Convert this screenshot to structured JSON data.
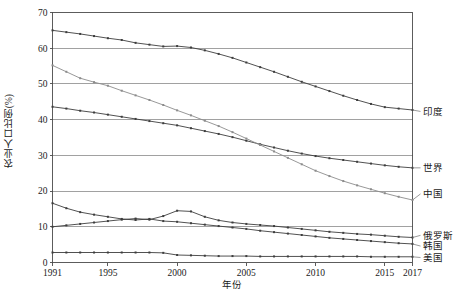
{
  "chart_data": {
    "type": "line",
    "title": "",
    "xlabel": "年份",
    "ylabel": "农业人口比例(%)",
    "xlim": [
      1991,
      2017
    ],
    "ylim": [
      0,
      70
    ],
    "ytick_values": [
      0,
      10,
      20,
      30,
      40,
      50,
      60,
      70
    ],
    "ytick_labels": [
      "0",
      "10",
      "20",
      "30",
      "40",
      "50",
      "60",
      "70"
    ],
    "xtick_values": [
      1991,
      1995,
      2000,
      2005,
      2010,
      2015,
      2017
    ],
    "xtick_labels": [
      "1991",
      "1995",
      "2000",
      "2005",
      "2010",
      "2015",
      "2017"
    ],
    "grid": "horizontal",
    "legend_position": "right-inline-labels",
    "x": [
      1991,
      1992,
      1993,
      1994,
      1995,
      1996,
      1997,
      1998,
      1999,
      2000,
      2001,
      2002,
      2003,
      2004,
      2005,
      2006,
      2007,
      2008,
      2009,
      2010,
      2011,
      2012,
      2013,
      2014,
      2015,
      2016,
      2017
    ],
    "series": [
      {
        "name": "印度",
        "color": "#3d3d3d",
        "values": [
          65.0,
          64.5,
          64.0,
          63.4,
          62.8,
          62.3,
          61.5,
          61.0,
          60.5,
          60.6,
          60.2,
          59.4,
          58.4,
          57.3,
          56.0,
          54.7,
          53.4,
          52.0,
          50.6,
          49.3,
          48.0,
          46.7,
          45.5,
          44.4,
          43.5,
          43.1,
          42.7
        ]
      },
      {
        "name": "世界",
        "color": "#3d3d3d",
        "values": [
          43.6,
          43.1,
          42.5,
          42.0,
          41.4,
          40.8,
          40.2,
          39.6,
          39.0,
          38.4,
          37.6,
          36.8,
          36.0,
          35.1,
          34.1,
          33.1,
          32.2,
          31.3,
          30.5,
          29.8,
          29.2,
          28.7,
          28.2,
          27.7,
          27.2,
          26.8,
          26.5
        ]
      },
      {
        "name": "中国",
        "color": "#8c8c8c",
        "values": [
          55.2,
          53.4,
          51.6,
          50.5,
          49.5,
          48.1,
          46.8,
          45.5,
          44.1,
          42.6,
          41.2,
          39.7,
          38.2,
          36.5,
          34.7,
          32.9,
          31.1,
          29.3,
          27.5,
          25.7,
          24.2,
          22.8,
          21.6,
          20.5,
          19.4,
          18.4,
          17.5
        ]
      },
      {
        "name": "俄罗斯",
        "color": "#3d3d3d",
        "values": [
          10.0,
          10.4,
          10.8,
          11.2,
          11.6,
          12.0,
          12.3,
          12.0,
          13.0,
          14.5,
          14.3,
          12.8,
          11.8,
          11.2,
          10.8,
          10.5,
          10.2,
          9.8,
          9.4,
          9.0,
          8.6,
          8.3,
          8.0,
          7.8,
          7.5,
          7.2,
          7.0
        ]
      },
      {
        "name": "韩国",
        "color": "#3d3d3d",
        "values": [
          16.6,
          15.2,
          14.1,
          13.4,
          12.8,
          12.2,
          11.9,
          12.2,
          11.6,
          11.4,
          11.0,
          10.6,
          10.2,
          9.8,
          9.4,
          8.9,
          8.5,
          8.1,
          7.7,
          7.3,
          6.9,
          6.6,
          6.3,
          6.0,
          5.7,
          5.4,
          5.2
        ]
      },
      {
        "name": "美国",
        "color": "#3d3d3d",
        "values": [
          2.8,
          2.8,
          2.8,
          2.8,
          2.8,
          2.8,
          2.8,
          2.8,
          2.7,
          2.1,
          2.0,
          1.9,
          1.8,
          1.8,
          1.8,
          1.7,
          1.7,
          1.7,
          1.7,
          1.7,
          1.7,
          1.7,
          1.7,
          1.6,
          1.6,
          1.6,
          1.6
        ]
      }
    ],
    "label_anchors": [
      {
        "name": "印度",
        "y_value": 42.7,
        "label_y_value": 42.3
      },
      {
        "name": "世界",
        "y_value": 26.5,
        "label_y_value": 26.5
      },
      {
        "name": "中国",
        "y_value": 17.5,
        "label_y_value": 19.2
      },
      {
        "name": "俄罗斯",
        "y_value": 7.0,
        "label_y_value": 7.6
      },
      {
        "name": "韩国",
        "y_value": 5.2,
        "label_y_value": 4.6
      },
      {
        "name": "美国",
        "y_value": 1.6,
        "label_y_value": 1.4
      }
    ]
  }
}
